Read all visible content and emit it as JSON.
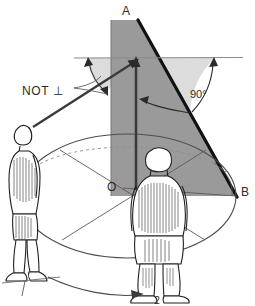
{
  "figure": {
    "labels": {
      "apex": "A",
      "base_right": "B",
      "center": "O",
      "not_perpendicular": "NOT ⊥",
      "right_angle": "90°",
      "position_one": "1",
      "position_two": "2"
    },
    "colors": {
      "triangle_fill": "#9a9a9a",
      "fan_fill": "#dcdcdc",
      "ink": "#2b2b2b",
      "line_light": "#6f6f6f",
      "paper": "#ffffff",
      "figure_fill": "#ffffff"
    },
    "geometry": {
      "apex": [
        138,
        20
      ],
      "base_right": [
        236,
        196
      ],
      "center": [
        123,
        188
      ],
      "triangle_left_edge_x": 111,
      "horizon_y": 58,
      "ellipse_center": [
        128,
        196
      ],
      "ellipse_rx": 108,
      "ellipse_ry": 62
    },
    "elements": [
      "shaded-right-triangle",
      "left-angle-fan",
      "right-angle-fan",
      "horizon-line",
      "vertical-pole-arrow",
      "sight-line-arrow",
      "ground-ellipse",
      "diameter-lines",
      "standing-figure-side",
      "standing-figure-rear",
      "turn-arrow"
    ]
  }
}
